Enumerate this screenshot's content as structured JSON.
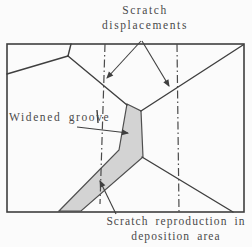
{
  "figure": {
    "type": "schematic-diagram",
    "description_topic": "scratch reproduction in a deposited film over grain boundaries",
    "colors": {
      "background": "#fbfbfb",
      "line": "#3f3f3f",
      "band_fill": "#d3d3d3",
      "band_stroke": "#4f4f4f",
      "text": "#4a4a4a"
    },
    "labels": {
      "scratch_displacements": {
        "line1": "Scratch",
        "line2": "displacements"
      },
      "widened_groove": "Widened groove",
      "scratch_reproduction": {
        "line1": "Scratch reproduction in",
        "line2": "deposition area"
      }
    }
  }
}
